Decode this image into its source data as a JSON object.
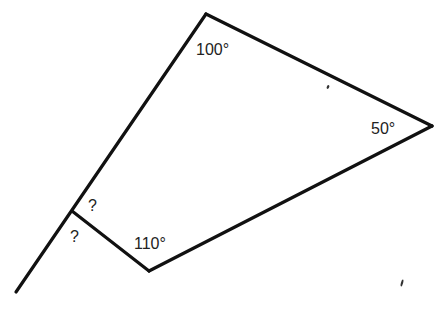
{
  "diagram": {
    "type": "quadrilateral-with-exterior-line",
    "vertices": {
      "top": {
        "x": 206,
        "y": 14,
        "angle_label": "100°"
      },
      "right": {
        "x": 432,
        "y": 126,
        "angle_label": "50°"
      },
      "bottom": {
        "x": 149,
        "y": 271,
        "angle_label": "110°"
      },
      "left": {
        "x": 72,
        "y": 211,
        "angle_label": "?"
      }
    },
    "extension_line": {
      "from": {
        "x": 206,
        "y": 14
      },
      "to": {
        "x": 16,
        "y": 292
      }
    },
    "labels": {
      "top_angle": "100°",
      "right_angle": "50°",
      "bottom_angle": "110°",
      "interior_unknown": "?",
      "exterior_unknown": "?"
    },
    "colors": {
      "line": "#111111",
      "text": "#222222",
      "background": "#ffffff"
    }
  }
}
